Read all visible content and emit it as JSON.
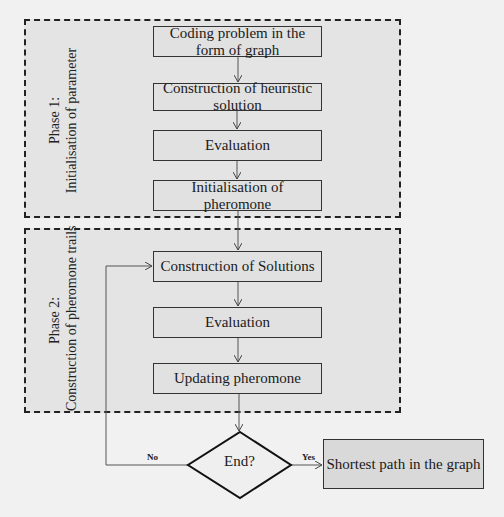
{
  "diagram": {
    "type": "flowchart",
    "phases": [
      {
        "id": "phase1",
        "title": "Phase 1:",
        "subtitle": "Initialisation of parameter"
      },
      {
        "id": "phase2",
        "title": "Phase 2:",
        "subtitle": "Construction of pheromone trails"
      }
    ],
    "nodes": [
      {
        "id": "n1",
        "label": "Coding problem in the form of graph",
        "phase": "phase1"
      },
      {
        "id": "n2",
        "label": "Construction of heuristic solution",
        "phase": "phase1"
      },
      {
        "id": "n3",
        "label": "Evaluation",
        "phase": "phase1"
      },
      {
        "id": "n4",
        "label": "Initialisation of pheromone",
        "phase": "phase1"
      },
      {
        "id": "n5",
        "label": "Construction of Solutions",
        "phase": "phase2"
      },
      {
        "id": "n6",
        "label": "Evaluation",
        "phase": "phase2"
      },
      {
        "id": "n7",
        "label": "Updating pheromone",
        "phase": "phase2"
      }
    ],
    "decision": {
      "id": "d1",
      "label": "End?"
    },
    "terminal": {
      "id": "t1",
      "label": "Shortest path in the graph"
    },
    "edges": [
      {
        "from": "n1",
        "to": "n2"
      },
      {
        "from": "n2",
        "to": "n3"
      },
      {
        "from": "n3",
        "to": "n4"
      },
      {
        "from": "n4",
        "to": "n5"
      },
      {
        "from": "n5",
        "to": "n6"
      },
      {
        "from": "n6",
        "to": "n7"
      },
      {
        "from": "n7",
        "to": "d1"
      },
      {
        "from": "d1",
        "to": "n5",
        "label": "No"
      },
      {
        "from": "d1",
        "to": "t1",
        "label": "Yes"
      }
    ],
    "edge_labels": {
      "no": "No",
      "yes": "Yes"
    }
  }
}
